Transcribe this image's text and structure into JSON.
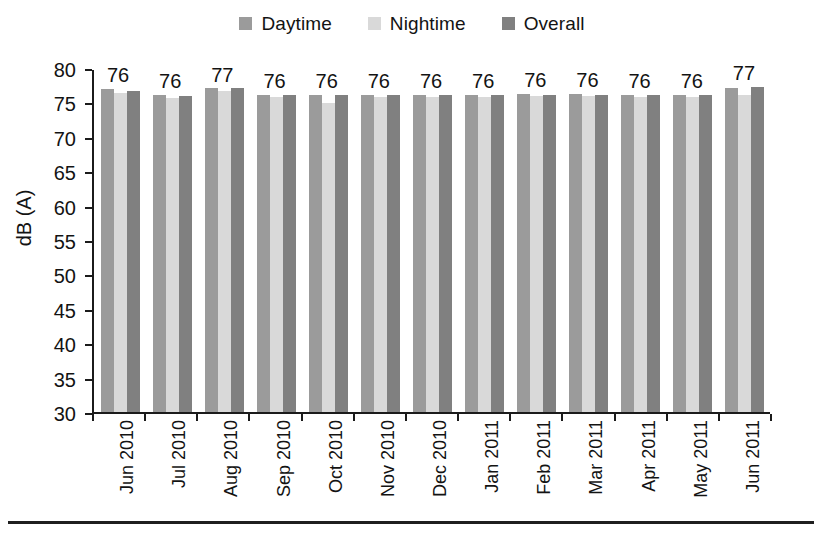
{
  "chart_data": {
    "type": "bar",
    "title": "",
    "subtitle": "",
    "xlabel": "",
    "ylabel": "dB (A)",
    "ylim": [
      30,
      80
    ],
    "ytick_step": 5,
    "yticks": [
      80,
      75,
      70,
      65,
      60,
      55,
      50,
      45,
      40,
      35,
      30
    ],
    "grid": false,
    "legend_position": "top-center",
    "categories": [
      "Jun 2010",
      "Jul 2010",
      "Aug 2010",
      "Sep 2010",
      "Oct 2010",
      "Nov 2010",
      "Dec 2010",
      "Jan 2011",
      "Feb 2011",
      "Mar 2011",
      "Apr 2011",
      "May 2011",
      "Jun 2011"
    ],
    "series": [
      {
        "name": "Daytime",
        "color": "#9b9b9b",
        "values": [
          77.2,
          76.3,
          77.3,
          76.4,
          76.3,
          76.4,
          76.4,
          76.4,
          76.5,
          76.5,
          76.4,
          76.4,
          77.4
        ]
      },
      {
        "name": "Nightime",
        "color": "#d9d9d9",
        "values": [
          76.6,
          75.9,
          77.0,
          76.1,
          75.2,
          76.0,
          76.1,
          76.1,
          76.2,
          76.2,
          76.0,
          76.0,
          76.4
        ]
      },
      {
        "name": "Overall",
        "color": "#808080",
        "values": [
          77.0,
          76.2,
          77.3,
          76.3,
          76.3,
          76.3,
          76.3,
          76.3,
          76.4,
          76.4,
          76.3,
          76.3,
          77.5
        ]
      }
    ],
    "data_labels": [
      "76",
      "76",
      "77",
      "76",
      "76",
      "76",
      "76",
      "76",
      "76",
      "76",
      "76",
      "76",
      "77"
    ]
  },
  "legend": {
    "items": [
      {
        "label": "Daytime",
        "color": "#9b9b9b"
      },
      {
        "label": "Nightime",
        "color": "#d9d9d9"
      },
      {
        "label": "Overall",
        "color": "#808080"
      }
    ]
  },
  "axis": {
    "y_title": "dB (A)"
  }
}
